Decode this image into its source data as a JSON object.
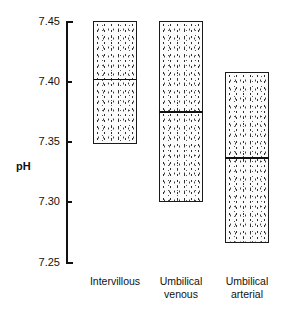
{
  "chart_data": {
    "type": "bar",
    "title": "",
    "subtitle": "",
    "xlabel": "",
    "ylabel": "pH",
    "ylim": [
      7.25,
      7.45
    ],
    "yticks": [
      "7.25",
      "7.30",
      "7.35",
      "7.40",
      "7.45"
    ],
    "ytick_values": [
      7.25,
      7.3,
      7.35,
      7.4,
      7.45
    ],
    "grid": false,
    "legend": "none",
    "categories": [
      "Intervillous",
      "Umbilical venous",
      "Umbilical arterial"
    ],
    "category_lines": [
      [
        "Intervillous",
        ""
      ],
      [
        "Umbilical",
        "venous"
      ],
      [
        "Umbilical",
        "arterial"
      ]
    ],
    "series": [
      {
        "name": "pH range",
        "boxes": [
          {
            "category": "Intervillous",
            "low": 7.348,
            "high": 7.45,
            "median": 7.402
          },
          {
            "category": "Umbilical venous",
            "low": 7.3,
            "high": 7.45,
            "median": 7.375
          },
          {
            "category": "Umbilical arterial",
            "low": 7.266,
            "high": 7.408,
            "median": 7.337
          }
        ]
      }
    ],
    "style": {
      "box_fill": "#fbfbfb",
      "box_stipple": "#2c2c2c",
      "box_border": "#1a1a1a",
      "median_color": "#101010",
      "axis_color": "#111111",
      "background": "#ffffff"
    }
  },
  "axis": {
    "title": "pH",
    "ticks": [
      {
        "label": "7.45",
        "value": 7.45
      },
      {
        "label": "7.40",
        "value": 7.4
      },
      {
        "label": "7.35",
        "value": 7.35
      },
      {
        "label": "7.30",
        "value": 7.3
      },
      {
        "label": "7.25",
        "value": 7.25
      }
    ]
  },
  "categories": [
    {
      "line1": "Intervillous",
      "line2": ""
    },
    {
      "line1": "Umbilical",
      "line2": "venous"
    },
    {
      "line1": "Umbilical",
      "line2": "arterial"
    }
  ]
}
